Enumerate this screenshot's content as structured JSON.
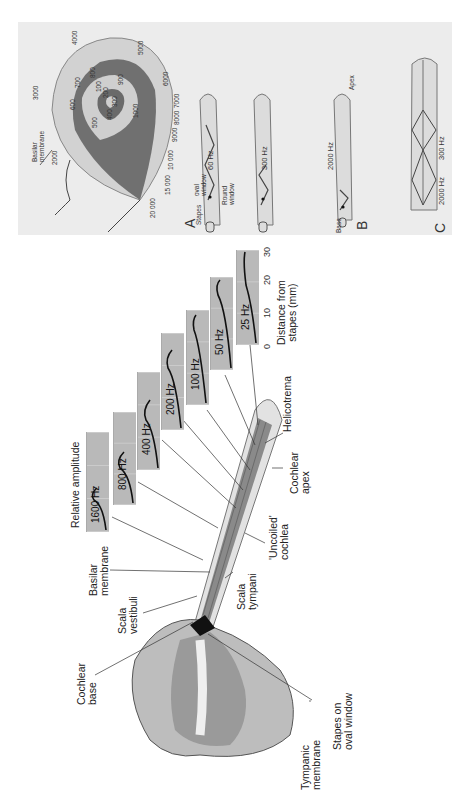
{
  "figure": {
    "style": "grayscale",
    "colors": {
      "panel_bg": "#ececec",
      "spiral_dark": "#6a6a6a",
      "spiral_light": "#d0d0d0",
      "strip_bg": "#b9b9b9",
      "curve": "#111111"
    }
  },
  "spiral_panel": {
    "basilar_label": "Basilar\nmembrane",
    "frequencies_outer": [
      "20 000",
      "15 000",
      "10 000",
      "9000",
      "8000",
      "7000",
      "6000",
      "5000",
      "4000",
      "3000",
      "2000"
    ],
    "frequencies_inner": [
      "1000",
      "900",
      "800",
      "700",
      "600",
      "500",
      "400",
      "300",
      "200",
      "100"
    ]
  },
  "panel_a": {
    "letter": "A",
    "stapes": "Stapes",
    "oval_window": "oval\nwindow",
    "round_window": "Round\nwindow",
    "freq_1": "60 Hz",
    "freq_2": "300 Hz"
  },
  "panel_b": {
    "letter": "B",
    "base": "Base",
    "apex": "Apex",
    "freq": "2000 Hz"
  },
  "panel_c": {
    "letter": "C",
    "freq_1": "2000 Hz",
    "freq_2": "300 Hz"
  },
  "traveling_wave": {
    "y_label": "Relative amplitude",
    "x_label": "Distance from\nstapes (mm)",
    "x_ticks": [
      "0",
      "10",
      "20",
      "30"
    ],
    "strips": [
      {
        "label": "1600 Hz"
      },
      {
        "label": "800 Hz"
      },
      {
        "label": "400 Hz"
      },
      {
        "label": "200 Hz"
      },
      {
        "label": "100 Hz"
      },
      {
        "label": "50 Hz"
      },
      {
        "label": "25 Hz"
      }
    ]
  },
  "anatomy": {
    "cochlear_base": "Cochlear\nbase",
    "scala_vestibuli": "Scala\nvestibuli",
    "basilar_membrane": "Basilar\nmembrane",
    "scala_tympani": "Scala\ntympani",
    "uncoiled_cochlea": "'Uncoiled'\ncochlea",
    "cochlear_apex": "Cochlear\napex",
    "helicotrema": "Helicotrema",
    "tympanic_membrane": "Tympanic\nmembrane",
    "stapes_oval_window": "Stapes on\noval window"
  }
}
